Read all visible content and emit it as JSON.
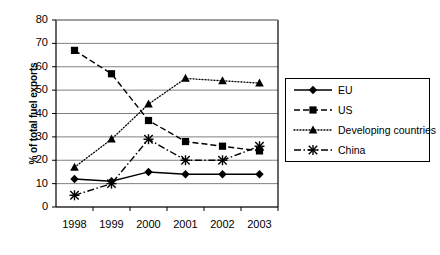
{
  "chart_data": {
    "type": "line",
    "title": "",
    "xlabel": "",
    "ylabel": "% of total fuel exports",
    "categories": [
      "1998",
      "1999",
      "2000",
      "2001",
      "2002",
      "2003"
    ],
    "ylim": [
      0,
      80
    ],
    "yticks": [
      0,
      10,
      20,
      30,
      40,
      50,
      60,
      70,
      80
    ],
    "grid": true,
    "legend_position": "right",
    "series": [
      {
        "name": "EU",
        "marker": "diamond",
        "line_style": "solid",
        "color": "#000000",
        "values": [
          12,
          11,
          15,
          14,
          14,
          14
        ]
      },
      {
        "name": "US",
        "marker": "square",
        "line_style": "dashed",
        "color": "#000000",
        "values": [
          67,
          57,
          37,
          28,
          26,
          24
        ]
      },
      {
        "name": "Developing countries",
        "marker": "triangle",
        "line_style": "dotted",
        "color": "#000000",
        "values": [
          17,
          29,
          44,
          55,
          54,
          53
        ]
      },
      {
        "name": "China",
        "marker": "cross",
        "line_style": "dashdot",
        "color": "#000000",
        "values": [
          5,
          10,
          29,
          20,
          20,
          26
        ]
      }
    ]
  },
  "axis": {
    "ylabel": "% of total fuel exports",
    "ytick_labels": [
      "80",
      "70",
      "60",
      "50",
      "40",
      "30",
      "20",
      "10",
      "0"
    ],
    "xtick_labels": [
      "1998",
      "1999",
      "2000",
      "2001",
      "2002",
      "2003"
    ]
  },
  "legend": {
    "items": [
      {
        "label": "EU"
      },
      {
        "label": "US"
      },
      {
        "label": "Developing countries"
      },
      {
        "label": "China"
      }
    ]
  }
}
